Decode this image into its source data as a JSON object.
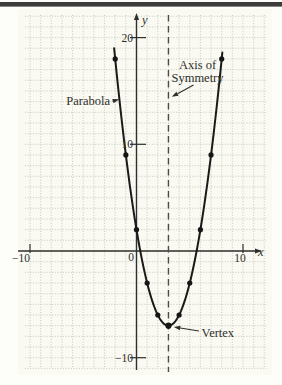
{
  "page": {
    "top_rule_color": "#3d3d3b",
    "paper_tint": "#faf9f2",
    "background": "#fdfdfa"
  },
  "chart_data": {
    "type": "scatter",
    "title": "",
    "x_axis": {
      "label": "x",
      "origin_label": "0",
      "ticks": [
        {
          "value": -10,
          "label": "−10"
        },
        {
          "value": 10,
          "label": "10"
        }
      ],
      "range": [
        -10.5,
        12.2
      ]
    },
    "y_axis": {
      "label": "y",
      "ticks": [
        {
          "value": 20,
          "label": "20"
        },
        {
          "value": 10,
          "label": "10"
        },
        {
          "value": -10,
          "label": "−10"
        }
      ],
      "range": [
        -11,
        22.3
      ]
    },
    "grid": {
      "on": true,
      "unit": 1,
      "x_lines_from": -10,
      "x_lines_to": 12,
      "y_lines_from": -11,
      "y_lines_to": 22
    },
    "axis_of_symmetry": {
      "x": 3
    },
    "vertex": {
      "x": 3,
      "y": -7
    },
    "points": [
      {
        "x": -2,
        "y": 18
      },
      {
        "x": -1,
        "y": 9
      },
      {
        "x": 0,
        "y": 2
      },
      {
        "x": 1,
        "y": -3
      },
      {
        "x": 2,
        "y": -6
      },
      {
        "x": 3,
        "y": -7
      },
      {
        "x": 4,
        "y": -6
      },
      {
        "x": 5,
        "y": -3
      },
      {
        "x": 6,
        "y": 2
      },
      {
        "x": 7,
        "y": 9
      },
      {
        "x": 8,
        "y": 18
      }
    ],
    "curve_domain": [
      -2.1,
      8.1
    ],
    "annotations": {
      "parabola": {
        "text": "Parabola"
      },
      "axis_of_symmetry": {
        "line1": "Axis of",
        "line2": "Symmetry"
      },
      "vertex": {
        "text": "Vertex"
      }
    },
    "colors": {
      "curve": "#1a1a18",
      "points": "#161614",
      "axis": "#2f2f2d",
      "grid": "#b5c0b2",
      "dashed": "#4b4b48",
      "text": "#2f2f2d"
    }
  }
}
